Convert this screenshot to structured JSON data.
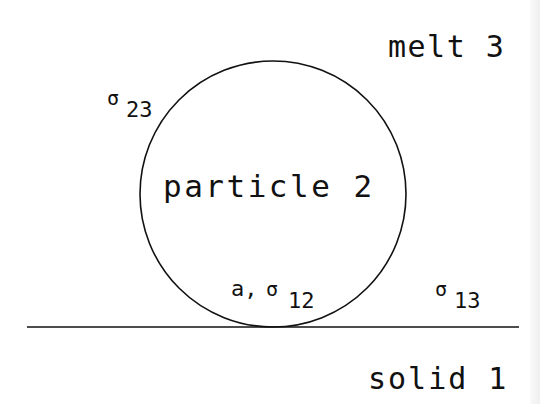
{
  "diagram": {
    "type": "physical-schematic",
    "colors": {
      "background": "#ffffff",
      "ink": "#111111",
      "edge_band": "#efefef"
    },
    "regions": {
      "melt": {
        "label": "melt 3"
      },
      "solid": {
        "label": "solid 1"
      },
      "particle": {
        "label": "particle 2"
      }
    },
    "interface_labels": {
      "sigma_23": {
        "symbol": "σ",
        "subscript": "23"
      },
      "sigma_13": {
        "symbol": "σ",
        "subscript": "13"
      },
      "contact": {
        "prefix": "a,",
        "symbol": "σ",
        "subscript": "12"
      }
    },
    "geometry": {
      "circle": {
        "cx": 273,
        "cy": 194,
        "r": 133
      },
      "surface_line": {
        "x1": 27,
        "y1": 327,
        "x2": 519,
        "y2": 327
      }
    }
  }
}
